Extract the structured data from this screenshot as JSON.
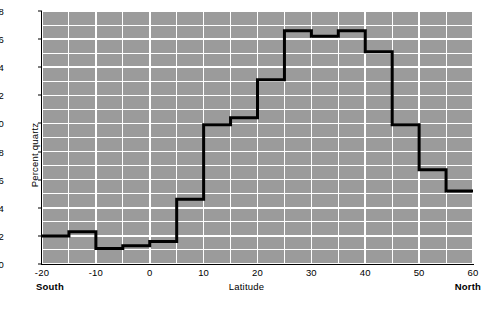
{
  "chart_data": {
    "type": "line",
    "subtype": "step",
    "title": "",
    "xlabel": "Latitude",
    "ylabel": "Percent quartz",
    "xlim": [
      -20,
      60
    ],
    "ylim": [
      0,
      18
    ],
    "xticks": [
      -20,
      -10,
      0,
      10,
      20,
      30,
      40,
      50,
      60
    ],
    "xtick_labels": [
      "-20",
      "-10",
      "0",
      "10",
      "20",
      "30",
      "40",
      "50",
      "60"
    ],
    "yticks": [
      0,
      2,
      4,
      6,
      8,
      10,
      12,
      14,
      16,
      18
    ],
    "ytick_labels": [
      "0",
      "2",
      "4",
      "6",
      "8",
      "10",
      "12",
      "14",
      "16",
      "18"
    ],
    "x_minor_step": 5,
    "y_minor_step": 1,
    "grid": true,
    "grid_color": "#ffffff",
    "plot_background": "#9b9b9b",
    "line_color": "#000000",
    "line_width": 3,
    "legend": null,
    "axis_annotations": [
      {
        "text": "South",
        "at_x": -20
      },
      {
        "text": "North",
        "at_x": 60
      }
    ],
    "bin_width": 5,
    "bin_edges": [
      -20,
      -15,
      -10,
      -5,
      0,
      5,
      10,
      15,
      20,
      25,
      30,
      35,
      40,
      45,
      50,
      55,
      60
    ],
    "bin_centers": [
      -17.5,
      -12.5,
      -7.5,
      -2.5,
      2.5,
      7.5,
      12.5,
      17.5,
      22.5,
      27.5,
      32.5,
      37.5,
      42.5,
      47.5,
      52.5,
      57.5
    ],
    "values": [
      2.0,
      2.3,
      1.1,
      1.3,
      1.6,
      4.6,
      9.9,
      10.4,
      13.1,
      16.6,
      16.2,
      16.6,
      15.1,
      9.9,
      6.7,
      5.2
    ]
  },
  "axes": {
    "y_title": "Percent quartz",
    "x_title": "Latitude",
    "south": "South",
    "north": "North"
  }
}
